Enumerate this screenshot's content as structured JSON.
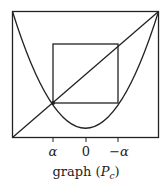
{
  "diagram": {
    "type": "cobweb-graph",
    "caption": "graph (",
    "caption_var": "P",
    "caption_sub": "c",
    "caption_close": ")",
    "x_ticks": [
      {
        "label": "α",
        "x": 53
      },
      {
        "label": "0",
        "x": 86
      },
      {
        "label": "−α",
        "x": 118
      }
    ],
    "elements": [
      "bounding-square",
      "diagonal y=x",
      "parabola",
      "period-2 square cycle",
      "fixed point α"
    ],
    "colors": {
      "line": "#222222",
      "background": "#ffffff"
    }
  }
}
